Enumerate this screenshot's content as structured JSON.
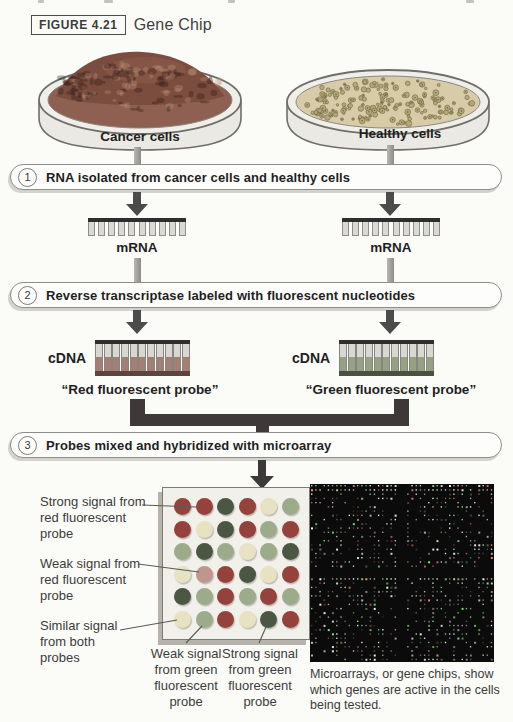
{
  "figure": {
    "label": "FIGURE 4.21",
    "title": "Gene Chip"
  },
  "dishes": {
    "cancer": {
      "label": "Cancer cells"
    },
    "healthy": {
      "label": "Healthy cells"
    }
  },
  "steps": [
    {
      "number": "1",
      "text": "RNA isolated from cancer cells and healthy cells"
    },
    {
      "number": "2",
      "text": "Reverse transcriptase labeled with fluorescent nucleotides"
    },
    {
      "number": "3",
      "text": "Probes mixed and hybridized with microarray"
    }
  ],
  "mrna": {
    "left_label": "mRNA",
    "right_label": "mRNA"
  },
  "cdna": {
    "left": {
      "label": "cDNA",
      "probe": "“Red fluorescent probe”"
    },
    "right": {
      "label": "cDNA",
      "probe": "“Green fluorescent probe”"
    }
  },
  "microarray": {
    "annotations": {
      "strong_red": "Strong signal from\nred fluorescent\nprobe",
      "weak_red": "Weak signal from\nred fluorescent\nprobe",
      "similar_both": "Similar signal\nfrom both\nprobes",
      "weak_green": "Weak signal\nfrom green\nfluorescent\nprobe",
      "strong_green": "Strong signal\nfrom green\nfluorescent\nprobe"
    },
    "grid": {
      "rows": 6,
      "cols": 6,
      "cells": [
        [
          "red",
          "red",
          "dgreen",
          "red",
          "yellow",
          "green"
        ],
        [
          "red",
          "yellow",
          "dgreen",
          "red",
          "green",
          "red"
        ],
        [
          "green",
          "dgreen",
          "green",
          "yellow",
          "green",
          "dgreen"
        ],
        [
          "yellow",
          "pink",
          "red",
          "dgreen",
          "yellow",
          "red"
        ],
        [
          "dgreen",
          "green",
          "red",
          "green",
          "red",
          "green"
        ],
        [
          "yellow",
          "green",
          "red",
          "yellow",
          "dgreen",
          "red"
        ]
      ],
      "palette": {
        "red": "#96423c",
        "dgreen": "#4b5743",
        "green": "#9cab8a",
        "yellow": "#e6e2c2",
        "pink": "#c0968c"
      }
    },
    "photo_caption": "Microarrays, or gene chips, show which genes are active in the cells being tested."
  },
  "colors": {
    "connector_gray": "#9a9893",
    "arrow_gray": "#4c4c4c",
    "merge_dark": "#3e3938",
    "cancer_mass": "#7b4d3f",
    "healthy_surface": "#d7cca7"
  }
}
